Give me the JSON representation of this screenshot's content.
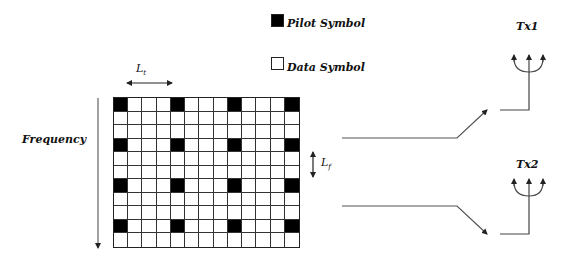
{
  "legend": {
    "pilot": {
      "label": "Pilot Symbol",
      "color": "#000000"
    },
    "data": {
      "label": "Data Symbol",
      "color": "#ffffff"
    }
  },
  "axis": {
    "frequency_label": "Frequency",
    "lt_label": "L",
    "lt_sub": "t",
    "lf_label": "L",
    "lf_sub": "f"
  },
  "grid": {
    "columns": 13,
    "rows": 11,
    "pilot_columns": [
      0,
      4,
      8,
      12
    ],
    "pilot_rows": [
      0,
      3,
      6,
      9
    ]
  },
  "antennas": [
    {
      "label": "Tx1"
    },
    {
      "label": "Tx2"
    }
  ]
}
